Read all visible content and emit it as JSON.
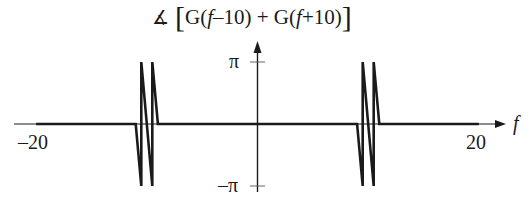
{
  "chart_data": {
    "type": "line",
    "title_parts": {
      "angle_symbol": "∡",
      "open_bracket": "[",
      "term1_prefix": "G(",
      "term1_var": "f",
      "term1_suffix": "–10)",
      "plus": " + ",
      "term2_prefix": "G(",
      "term2_var": "f",
      "term2_suffix": "+10)",
      "close_bracket": "]"
    },
    "xlabel": "f",
    "ylabel": "",
    "xlim": [
      -20,
      20
    ],
    "ylim": [
      -3.14159,
      3.14159
    ],
    "x_ticks": [
      {
        "value": -20,
        "label": "–20"
      },
      {
        "value": 20,
        "label": "20"
      }
    ],
    "y_ticks": [
      {
        "value": 3.14159,
        "label": "π"
      },
      {
        "value": -3.14159,
        "label": "–π"
      }
    ],
    "grid": false,
    "legend": "none",
    "series": [
      {
        "name": "phase",
        "x": [
          -20,
          -11,
          -10.5,
          -10.5,
          -9.5,
          -9.5,
          -9,
          9,
          9.5,
          9.5,
          10.5,
          10.5,
          11,
          20
        ],
        "y": [
          0,
          0,
          -3.14159,
          3.14159,
          -3.14159,
          3.14159,
          0,
          0,
          -3.14159,
          3.14159,
          -3.14159,
          3.14159,
          0,
          0
        ]
      }
    ]
  },
  "labels": {
    "x_axis_var": "f",
    "x_min": "–20",
    "x_max": "20",
    "y_pi": "π",
    "y_neg_pi": "–π"
  },
  "colors": {
    "line": "#1a1a1a",
    "axis": "#1a1a1a",
    "background": "#ffffff"
  }
}
